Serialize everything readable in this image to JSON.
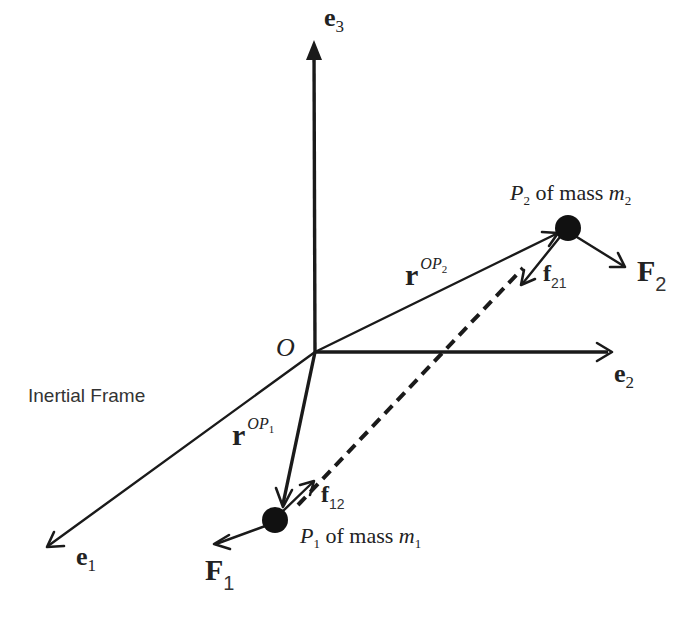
{
  "diagram": {
    "frame_label": "Inertial Frame",
    "origin_label": "O",
    "axes": {
      "e1": {
        "base": "e",
        "sub": "1"
      },
      "e2": {
        "base": "e",
        "sub": "2"
      },
      "e3": {
        "base": "e",
        "sub": "3"
      }
    },
    "particles": {
      "p1": {
        "name": "P",
        "name_sub": "1",
        "text": " of mass ",
        "mass": "m",
        "mass_sub": "1"
      },
      "p2": {
        "name": "P",
        "name_sub": "2",
        "text": " of mass ",
        "mass": "m",
        "mass_sub": "2"
      }
    },
    "position_vectors": {
      "r1": {
        "base": "r",
        "sup": "OP",
        "sup_sub": "1"
      },
      "r2": {
        "base": "r",
        "sup": "OP",
        "sup_sub": "2"
      }
    },
    "external_forces": {
      "F1": {
        "base": "F",
        "sub": "1"
      },
      "F2": {
        "base": "F",
        "sub": "2"
      }
    },
    "internal_forces": {
      "f12": {
        "base": "f",
        "sub": "12"
      },
      "f21": {
        "base": "f",
        "sub": "21"
      }
    },
    "colors": {
      "ink": "#1a1a1a",
      "background": "#ffffff"
    }
  }
}
